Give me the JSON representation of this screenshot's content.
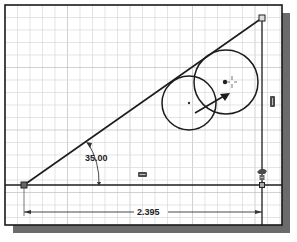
{
  "sketch": {
    "frame": {
      "x": 5,
      "y": 5,
      "width": 277,
      "height": 220,
      "shadow_color": "#6b6b6b",
      "border_color": "#1a1a1a"
    },
    "grid": {
      "spacing": 12.5,
      "minor_color": "#d9d9d9",
      "major_color": "#bdbdbd",
      "major_every": 5
    },
    "colors": {
      "geometry": "#1c1c1c",
      "point": "#555555",
      "dimension": "#333333",
      "constraint_icon": "#4a4a4a"
    },
    "geometry": {
      "baseline": {
        "x1": 5,
        "y1": 185,
        "x2": 282,
        "y2": 185
      },
      "incline_line": {
        "x1": 24,
        "y1": 185,
        "x2": 262,
        "y2": 18
      },
      "vertical_line": {
        "x1": 262,
        "y1": 18,
        "x2": 262,
        "y2": 225
      },
      "points": [
        {
          "name": "left-vertex",
          "x": 24,
          "y": 185
        },
        {
          "name": "top-right-vertex",
          "x": 262,
          "y": 18
        },
        {
          "name": "bottom-right-point",
          "x": 262,
          "y": 185
        }
      ],
      "circles": [
        {
          "name": "small-circle",
          "cx": 189,
          "cy": 103,
          "r": 27
        },
        {
          "name": "large-circle",
          "cx": 226,
          "cy": 82,
          "r": 32
        }
      ],
      "drag_arrow": {
        "x1": 195,
        "y1": 113,
        "x2": 229,
        "y2": 94
      }
    },
    "dimensions": {
      "angle": {
        "label": "35.00",
        "value": 35.0,
        "unit": "deg",
        "text_x": 99,
        "text_y": 161
      },
      "linear": {
        "label": "2.395",
        "value": 2.395,
        "text_x": 151,
        "text_y": 215,
        "y": 212,
        "x1": 24,
        "x2": 262
      }
    },
    "constraints": [
      {
        "name": "horizontal-constraint-icon",
        "x": 142,
        "y": 174
      },
      {
        "name": "vertical-constraint-icon",
        "x": 272,
        "y": 101
      },
      {
        "name": "coincident-constraint-icon",
        "x": 262,
        "y": 173
      }
    ]
  }
}
